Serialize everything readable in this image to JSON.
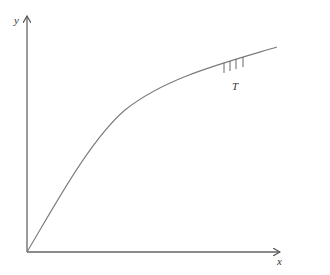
{
  "diagram": {
    "axes": {
      "x_label": "x",
      "y_label": "y",
      "origin": [
        27,
        252
      ],
      "x_end": [
        279,
        252
      ],
      "y_end": [
        27,
        16
      ]
    },
    "curve": {
      "description": "concave increasing curve starting at origin",
      "path": "M27,252 C55,205 90,140 125,110 C165,78 220,64 277,47",
      "color": "#7a7a7a"
    },
    "ticks": {
      "label": "T",
      "x_positions": [
        224,
        230,
        236,
        243
      ]
    },
    "colors": {
      "axis": "#666666",
      "curve": "#7a7a7a",
      "text": "#333333"
    }
  }
}
